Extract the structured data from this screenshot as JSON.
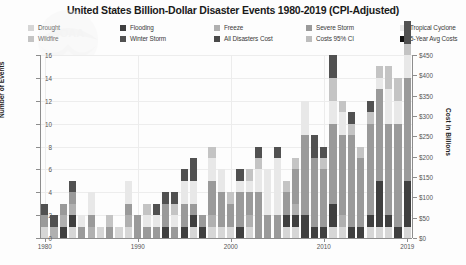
{
  "title": "United States Billion-Dollar Disaster Events 1980-2019 (CPI-Adjusted)",
  "watermark": "NOAA",
  "legend": {
    "items": [
      {
        "label": "Drought",
        "color": "#d6d6d6",
        "kind": "swatch"
      },
      {
        "label": "Flooding",
        "color": "#3f3f3f",
        "kind": "swatch"
      },
      {
        "label": "Freeze",
        "color": "#b0b0b0",
        "kind": "swatch"
      },
      {
        "label": "Severe Storm",
        "color": "#9a9a9a",
        "kind": "swatch"
      },
      {
        "label": "Tropical Cyclone",
        "color": "#e8e8e8",
        "kind": "swatch"
      },
      {
        "label": "Wildfire",
        "color": "#c4c4c4",
        "kind": "swatch"
      },
      {
        "label": "Winter Storm",
        "color": "#515151",
        "kind": "swatch"
      },
      {
        "label": "All Disasters Cost",
        "color": "#4a4a4a",
        "kind": "swatch"
      },
      {
        "label": "Costs 95% CI",
        "color": "#bdbdbd",
        "kind": "swatch"
      },
      {
        "label": "5-Year Avg Costs",
        "color": "#111111",
        "kind": "swatch"
      }
    ]
  },
  "axes": {
    "left": {
      "label": "Number of Events",
      "ticks": [
        "0",
        "2",
        "4",
        "6",
        "8",
        "10",
        "12",
        "14",
        "16"
      ],
      "min": 0,
      "max": 16
    },
    "right": {
      "label": "Cost in Billions",
      "ticks": [
        "$0",
        "$50",
        "$100",
        "$150",
        "$200",
        "$250",
        "$300",
        "$350",
        "$400",
        "$450"
      ],
      "min": 0,
      "max": 450
    },
    "bottom": {
      "ticks": [
        "1980",
        "1990",
        "2000",
        "2010",
        "2019"
      ]
    }
  },
  "chart_data": {
    "type": "bar",
    "title": "United States Billion-Dollar Disaster Events 1980-2019 (CPI-Adjusted)",
    "xlabel": "",
    "ylabel": "Number of Events",
    "ylabel_right": "Cost in Billions",
    "ylim": [
      0,
      16
    ],
    "ylim_right": [
      0,
      450
    ],
    "grid": true,
    "legend_position": "top",
    "stacked": true,
    "categories": [
      1980,
      1981,
      1982,
      1983,
      1984,
      1985,
      1986,
      1987,
      1988,
      1989,
      1990,
      1991,
      1992,
      1993,
      1994,
      1995,
      1996,
      1997,
      1998,
      1999,
      2000,
      2001,
      2002,
      2003,
      2004,
      2005,
      2006,
      2007,
      2008,
      2009,
      2010,
      2011,
      2012,
      2013,
      2014,
      2015,
      2016,
      2017,
      2018,
      2019
    ],
    "series": [
      {
        "name": "Drought",
        "color": "#d6d6d6",
        "values": [
          1,
          0,
          0,
          1,
          0,
          0,
          1,
          0,
          1,
          1,
          0,
          0,
          0,
          0,
          0,
          0,
          1,
          0,
          1,
          1,
          1,
          0,
          1,
          0,
          0,
          0,
          1,
          1,
          0,
          0,
          0,
          1,
          1,
          0,
          0,
          1,
          1,
          1,
          0,
          1
        ]
      },
      {
        "name": "Flooding",
        "color": "#3f3f3f",
        "values": [
          0,
          0,
          1,
          1,
          0,
          0,
          0,
          0,
          0,
          0,
          0,
          0,
          0,
          1,
          0,
          1,
          1,
          1,
          0,
          0,
          0,
          1,
          0,
          0,
          0,
          0,
          1,
          1,
          2,
          1,
          1,
          2,
          0,
          1,
          1,
          1,
          4,
          1,
          1,
          4
        ]
      },
      {
        "name": "Freeze",
        "color": "#b0b0b0",
        "values": [
          0,
          1,
          1,
          1,
          0,
          1,
          0,
          0,
          0,
          1,
          0,
          0,
          0,
          0,
          0,
          0,
          0,
          0,
          1,
          0,
          0,
          0,
          1,
          0,
          0,
          0,
          0,
          1,
          0,
          0,
          0,
          0,
          1,
          0,
          0,
          0,
          0,
          0,
          0,
          0
        ]
      },
      {
        "name": "Severe Storm",
        "color": "#9a9a9a",
        "values": [
          1,
          0,
          1,
          1,
          1,
          1,
          0,
          1,
          0,
          1,
          2,
          1,
          1,
          2,
          1,
          2,
          1,
          1,
          3,
          3,
          2,
          3,
          2,
          4,
          2,
          2,
          2,
          3,
          7,
          6,
          5,
          7,
          7,
          8,
          6,
          8,
          8,
          8,
          9,
          9
        ]
      },
      {
        "name": "Tropical Cyclone",
        "color": "#e8e8e8",
        "values": [
          0,
          0,
          0,
          0,
          1,
          2,
          0,
          0,
          0,
          2,
          0,
          1,
          1,
          0,
          1,
          2,
          2,
          0,
          2,
          2,
          0,
          1,
          1,
          2,
          4,
          5,
          0,
          0,
          3,
          0,
          0,
          2,
          2,
          0,
          0,
          0,
          1,
          3,
          2,
          2
        ]
      },
      {
        "name": "Wildfire",
        "color": "#c4c4c4",
        "values": [
          0,
          0,
          0,
          0,
          0,
          0,
          0,
          1,
          0,
          0,
          0,
          1,
          0,
          0,
          1,
          0,
          0,
          0,
          1,
          0,
          1,
          0,
          1,
          1,
          0,
          0,
          1,
          1,
          0,
          0,
          1,
          2,
          1,
          1,
          1,
          1,
          1,
          2,
          2,
          1
        ]
      },
      {
        "name": "Winter Storm",
        "color": "#515151",
        "values": [
          1,
          1,
          0,
          1,
          0,
          0,
          0,
          0,
          0,
          0,
          0,
          0,
          1,
          1,
          1,
          1,
          2,
          0,
          0,
          0,
          0,
          1,
          0,
          1,
          0,
          1,
          0,
          0,
          0,
          2,
          1,
          2,
          0,
          1,
          0,
          1,
          0,
          0,
          0,
          2
        ]
      }
    ],
    "cost_line": {
      "name": "All Disasters Cost",
      "color": "#4a4a4a",
      "values": [
        24,
        12,
        16,
        26,
        9,
        17,
        4,
        5,
        26,
        21,
        16,
        14,
        50,
        38,
        12,
        20,
        22,
        11,
        43,
        32,
        12,
        17,
        16,
        24,
        53,
        248,
        19,
        13,
        81,
        14,
        18,
        72,
        134,
        28,
        24,
        25,
        53,
        317,
        96,
        45
      ]
    },
    "cost_ci": {
      "name": "Costs 95% CI",
      "color": "#bdbdbd",
      "upper": [
        32,
        18,
        22,
        34,
        14,
        24,
        8,
        9,
        34,
        28,
        22,
        20,
        60,
        47,
        18,
        27,
        30,
        17,
        52,
        41,
        18,
        24,
        23,
        32,
        66,
        290,
        26,
        19,
        95,
        20,
        25,
        86,
        152,
        36,
        31,
        33,
        64,
        350,
        112,
        58
      ],
      "lower": [
        17,
        7,
        11,
        19,
        5,
        11,
        1,
        2,
        19,
        15,
        11,
        9,
        41,
        30,
        7,
        14,
        15,
        6,
        35,
        24,
        7,
        11,
        10,
        17,
        42,
        206,
        13,
        8,
        68,
        9,
        12,
        59,
        117,
        21,
        17,
        18,
        43,
        284,
        81,
        33
      ]
    },
    "avg5_line": {
      "name": "5-Year Avg Costs",
      "color": "#111111",
      "values": [
        null,
        null,
        null,
        null,
        17,
        16,
        14,
        12,
        12,
        15,
        14,
        14,
        23,
        29,
        26,
        26,
        29,
        21,
        22,
        26,
        24,
        25,
        20,
        18,
        24,
        63,
        71,
        63,
        71,
        75,
        29,
        40,
        64,
        53,
        55,
        57,
        53,
        96,
        107,
        107
      ]
    }
  }
}
